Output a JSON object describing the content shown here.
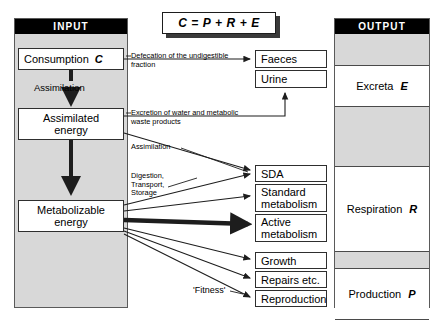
{
  "diagram": {
    "equation": "C = P + R + E",
    "input_column": {
      "header": "INPUT",
      "nodes": [
        {
          "label": "Consumption",
          "symbol": "C"
        },
        {
          "label": "Assimilated\nenergy",
          "symbol": ""
        },
        {
          "label": "Metabolizable\nenergy",
          "symbol": ""
        }
      ],
      "flow_label": "Assimilation"
    },
    "output_column": {
      "header": "OUTPUT",
      "bands": [
        {
          "label": "Excreta",
          "symbol": "E"
        },
        {
          "label": "Respiration",
          "symbol": "R"
        },
        {
          "label": "Production",
          "symbol": "P"
        }
      ]
    },
    "middle_nodes": [
      {
        "label": "Faeces"
      },
      {
        "label": "Urine"
      },
      {
        "label": "SDA"
      },
      {
        "label": "Standard\nmetabolism"
      },
      {
        "label": "Active\nmetabolism"
      },
      {
        "label": "Growth"
      },
      {
        "label": "Repairs etc."
      },
      {
        "label": "Reproduction"
      }
    ],
    "captions": {
      "defecation": "Defecation of the undigestible\nfraction",
      "excretion": "Excretion of water and metabolic\nwaste products",
      "assimilation": "Assimilation",
      "digestion": "Digestion,\nTransport,\nStorage",
      "fitness": "'Fitness'"
    },
    "colors": {
      "column_fill": "#d8d8d8",
      "header_fill": "#000000",
      "header_text": "#ffffff",
      "node_fill": "#ffffff",
      "line": "#1d1d1d"
    }
  }
}
